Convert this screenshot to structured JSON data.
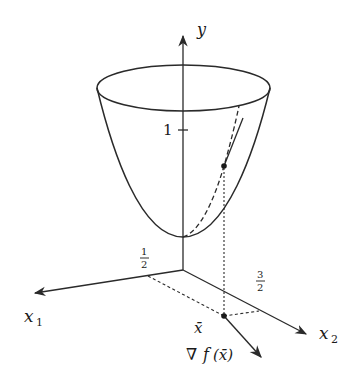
{
  "diagram": {
    "axes": {
      "y_label": "y",
      "x1_label": "x",
      "x1_sub": "1",
      "x2_label": "x",
      "x2_sub": "2"
    },
    "ticks": {
      "y_one": "1",
      "x1_half_num": "1",
      "x1_half_den": "2",
      "x2_threehalves_num": "3",
      "x2_threehalves_den": "2"
    },
    "point": {
      "label": "x̄"
    },
    "gradient": {
      "label_nabla": "∇",
      "label_f": "f",
      "label_arg": "(x̄)"
    },
    "colors": {
      "ink": "#2a2a2a",
      "background": "#ffffff"
    }
  }
}
